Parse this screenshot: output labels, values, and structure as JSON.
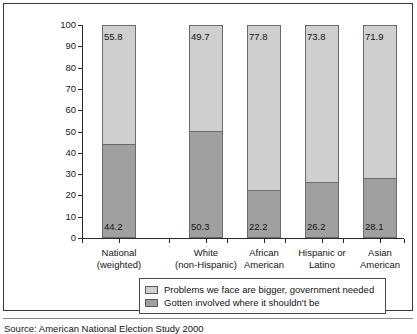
{
  "chart_data": {
    "type": "bar",
    "subtype": "stacked-100-percent",
    "title": "",
    "xlabel": "",
    "ylabel": "",
    "ylim": [
      0,
      100
    ],
    "ytick_step": 10,
    "yticks": [
      0,
      10,
      20,
      30,
      40,
      50,
      60,
      70,
      80,
      90,
      100
    ],
    "grid": false,
    "legend_position": "bottom",
    "categories": [
      "National (weighted)",
      "White (non-Hispanic)",
      "African American",
      "Hispanic or Latino",
      "Asian American"
    ],
    "category_lines": [
      [
        "National",
        "(weighted)"
      ],
      [
        "White",
        "(non-Hispanic)"
      ],
      [
        "African",
        "American"
      ],
      [
        "Hispanic or",
        "Latino"
      ],
      [
        "Asian",
        "American"
      ]
    ],
    "series": [
      {
        "name": "Problems we face are bigger, government needed",
        "color": "#cfcfcf",
        "values": [
          55.8,
          49.7,
          77.8,
          73.8,
          71.9
        ]
      },
      {
        "name": "Gotten involved where it shouldn't be",
        "color": "#a0a0a0",
        "values": [
          44.2,
          50.3,
          22.2,
          26.2,
          28.1
        ]
      }
    ]
  },
  "legend": {
    "items": [
      {
        "label": "Problems we face are bigger, government needed",
        "color": "#cfcfcf"
      },
      {
        "label": "Gotten involved where it shouldn't be",
        "color": "#a0a0a0"
      }
    ]
  },
  "source": {
    "text": "Source: American National Election Study 2000"
  }
}
